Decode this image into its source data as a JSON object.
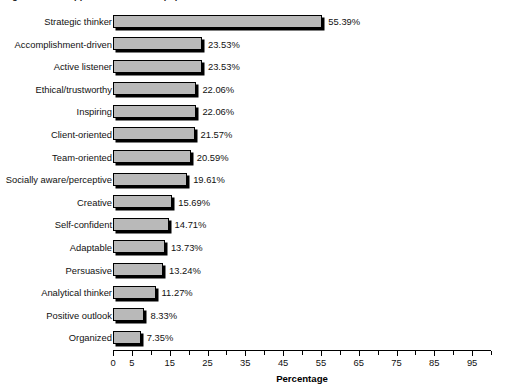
{
  "title_strip": {
    "text": "Figure 2. Most appreciated leadership qualities"
  },
  "chart_data": {
    "type": "bar",
    "orientation": "horizontal",
    "title": "",
    "xlabel": "Percentage",
    "ylabel": "",
    "xlim": [
      0,
      100
    ],
    "xticks": [
      0,
      5,
      10,
      15,
      20,
      25,
      30,
      35,
      40,
      45,
      50,
      55,
      60,
      65,
      70,
      75,
      80,
      85,
      90,
      95,
      100
    ],
    "xtick_labels": [
      "0",
      "5",
      "",
      "15",
      "",
      "25",
      "",
      "35",
      "",
      "45",
      "",
      "55",
      "",
      "65",
      "",
      "75",
      "",
      "85",
      "",
      "95",
      ""
    ],
    "xtick_step": 5,
    "grid": false,
    "legend": "none",
    "bar_fill": "#b9b9b9",
    "bar_stroke": "#000000",
    "categories": [
      "Strategic thinker",
      "Accomplishment-driven",
      "Active listener",
      "Ethical/trustworthy",
      "Inspiring",
      "Client-oriented",
      "Team-oriented",
      "Socially aware/perceptive",
      "Creative",
      "Self-confident",
      "Adaptable",
      "Persuasive",
      "Analytical thinker",
      "Positive outlook",
      "Organized"
    ],
    "values": [
      55.39,
      23.53,
      23.53,
      22.06,
      22.06,
      21.57,
      20.59,
      19.61,
      15.69,
      14.71,
      13.73,
      13.24,
      11.27,
      8.33,
      7.35
    ],
    "value_labels": [
      "55.39%",
      "23.53%",
      "23.53%",
      "22.06%",
      "22.06%",
      "21.57%",
      "20.59%",
      "19.61%",
      "15.69%",
      "14.71%",
      "13.73%",
      "13.24%",
      "11.27%",
      "8.33%",
      "7.35%"
    ]
  }
}
